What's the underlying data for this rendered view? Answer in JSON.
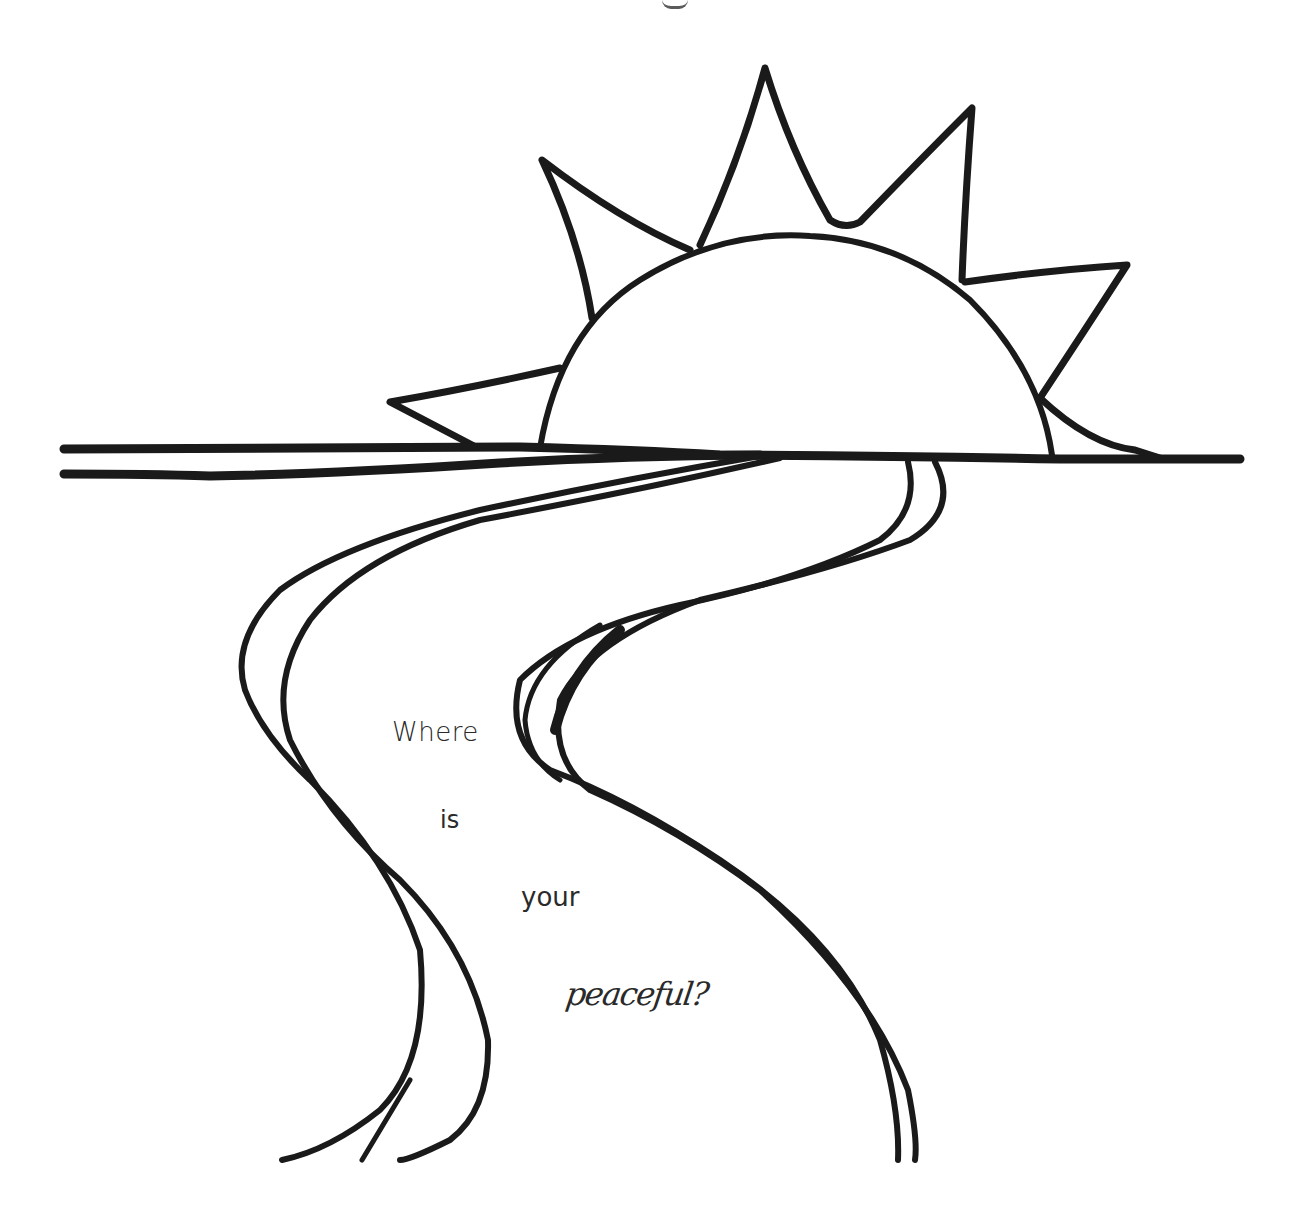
{
  "illustration": {
    "subject": "sunset over horizon with winding road",
    "colors": {
      "ink": "#1a1a1a",
      "background": "#ffffff",
      "text": "#2a2a2a"
    }
  },
  "caption": {
    "words": [
      "Where",
      "is",
      "your",
      "peaceful?"
    ]
  }
}
